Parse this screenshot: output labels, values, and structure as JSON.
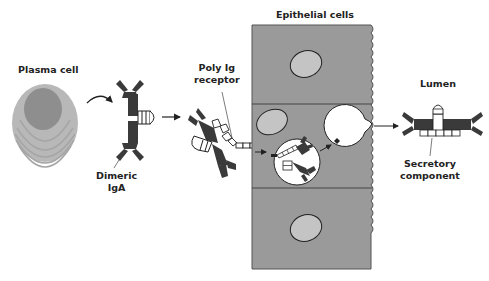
{
  "labels": {
    "plasma_cell": "Plasma cell",
    "dimeric_iga_line1": "Dimeric",
    "dimeric_iga_line2": "IgA",
    "poly_ig_receptor_line1": "Poly Ig",
    "poly_ig_receptor_line2": "receptor",
    "epithelial_cells": "Epithelial cells",
    "lumen": "Lumen",
    "secretory_component_line1": "Secretory",
    "secretory_component_line2": "component"
  },
  "colors": {
    "cell_fill": "#9a9a9a",
    "nucleus_fill": "#c4c4c4",
    "plasma_outer": "#b8b8b8",
    "plasma_nucleus": "#8e8e8e",
    "antibody": "#3a3a3a",
    "outline": "#222222",
    "background": "#ffffff"
  }
}
